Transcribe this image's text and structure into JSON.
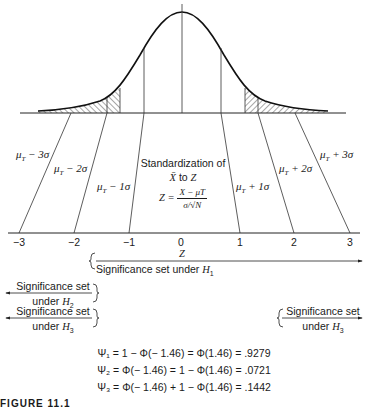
{
  "figure": {
    "caption": "FIGURE 11.1",
    "top_distribution": {
      "labels": [
        "μT − 3σ",
        "μT − 2σ",
        "μT − 1σ",
        "μT + 1σ",
        "μT + 2σ",
        "μT + 3σ"
      ],
      "label_parts": [
        {
          "base": "μ",
          "sub": "T",
          "rest": " − 3σ"
        },
        {
          "base": "μ",
          "sub": "T",
          "rest": " − 2σ"
        },
        {
          "base": "μ",
          "sub": "T",
          "rest": " − 1σ"
        },
        {
          "base": "μ",
          "sub": "T",
          "rest": " + 1σ"
        },
        {
          "base": "μ",
          "sub": "T",
          "rest": " + 2σ"
        },
        {
          "base": "μ",
          "sub": "T",
          "rest": " + 3σ"
        }
      ],
      "shaded_tails": "both"
    },
    "standardization": {
      "line1": "Standardization of",
      "line2_var": "X̄",
      "line2_rest": " to ",
      "line2_z": "Z",
      "formula_lhs": "Z =",
      "formula_num": "X − μT",
      "formula_den": "σ/√N"
    },
    "z_axis": {
      "label": "Z",
      "ticks": [
        "−3",
        "−2",
        "−1",
        "0",
        "1",
        "2",
        "3"
      ]
    },
    "significance_sets": {
      "h1": {
        "text": "Significance set under ",
        "hyp": "H",
        "sub": "1"
      },
      "h2": {
        "line1": "Significance set",
        "line2": "under ",
        "hyp": "H",
        "sub": "2"
      },
      "h3_left": {
        "line1": "Significance set",
        "line2": "under ",
        "hyp": "H",
        "sub": "3"
      },
      "h3_right": {
        "line1": "Significance set",
        "line2": "under ",
        "hyp": "H",
        "sub": "3"
      }
    },
    "formulas": [
      "Ψ₁ = 1 − Φ(− 1.46) = Φ(1.46) = .9279",
      "Ψ₂ = Φ(− 1.46) = 1 − Φ(1.46) = .0721",
      "Ψ₃ = Φ(− 1.46) + 1 − Φ(1.46) = .1442"
    ]
  }
}
